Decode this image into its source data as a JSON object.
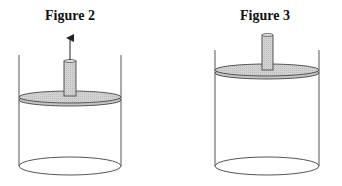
{
  "figures": [
    {
      "title": "Figure 2",
      "arrow": "up-arrow",
      "cx": 70,
      "piston_y": 97,
      "rod_top": 60
    },
    {
      "title": "Figure 3",
      "arrow": null,
      "cx": 267,
      "piston_y": 70,
      "rod_top": 34
    }
  ],
  "colors": {
    "line": "#555555",
    "piston_fill": "#cfcfcf",
    "rod_fill": "#c8c8c8",
    "title": "#111111"
  }
}
